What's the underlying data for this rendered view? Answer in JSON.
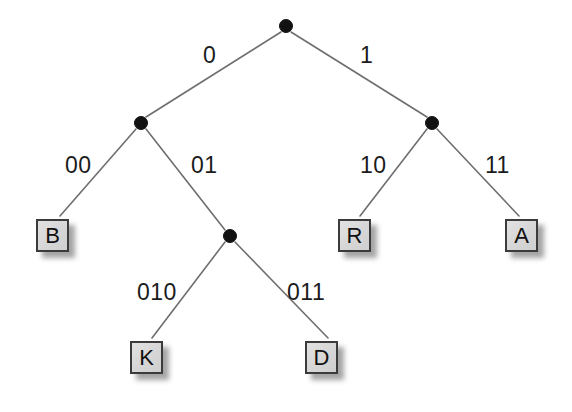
{
  "diagram": {
    "type": "binary-huffman-code-tree",
    "canvas": {
      "width": 572,
      "height": 412,
      "background": "#ffffff"
    },
    "style": {
      "edge_color": "#6e6e6e",
      "node_color": "#121212",
      "box_fill": "#d6d6d6",
      "box_border": "#3b3b3b",
      "text_color": "#1b1b1b",
      "shadow_color": "rgba(40,40,40,0.42)"
    },
    "nodes": [
      {
        "id": "root",
        "kind": "internal",
        "x": 286,
        "y": 26,
        "r": 6.5
      },
      {
        "id": "n0",
        "kind": "internal",
        "x": 141,
        "y": 123,
        "r": 6.5
      },
      {
        "id": "n1",
        "kind": "internal",
        "x": 432,
        "y": 123,
        "r": 6.5
      },
      {
        "id": "n01",
        "kind": "internal",
        "x": 230,
        "y": 236,
        "r": 6.5
      }
    ],
    "leaves": [
      {
        "id": "leaf-b",
        "label": "B",
        "code": "00",
        "x": 36,
        "y": 219
      },
      {
        "id": "leaf-k",
        "label": "K",
        "code": "010",
        "x": 130,
        "y": 341
      },
      {
        "id": "leaf-d",
        "label": "D",
        "code": "011",
        "x": 305,
        "y": 341
      },
      {
        "id": "leaf-r",
        "label": "R",
        "code": "10",
        "x": 338,
        "y": 219
      },
      {
        "id": "leaf-a",
        "label": "A",
        "code": "11",
        "x": 505,
        "y": 219
      }
    ],
    "edges": [
      {
        "id": "edge-0",
        "from": "root",
        "to": "n0",
        "label": "0",
        "label_x": 203,
        "label_y": 44,
        "x1": 281,
        "y1": 32,
        "x2": 146,
        "y2": 117
      },
      {
        "id": "edge-1",
        "from": "root",
        "to": "n1",
        "label": "1",
        "label_x": 360,
        "label_y": 44,
        "x1": 291,
        "y1": 32,
        "x2": 427,
        "y2": 117
      },
      {
        "id": "edge-00",
        "from": "n0",
        "to": "leaf-b",
        "label": "00",
        "label_x": 65,
        "label_y": 154,
        "x1": 136,
        "y1": 129,
        "x2": 60,
        "y2": 216
      },
      {
        "id": "edge-01",
        "from": "n0",
        "to": "n01",
        "label": "01",
        "label_x": 191,
        "label_y": 154,
        "x1": 146,
        "y1": 129,
        "x2": 225,
        "y2": 230
      },
      {
        "id": "edge-10",
        "from": "n1",
        "to": "leaf-r",
        "label": "10",
        "label_x": 360,
        "label_y": 154,
        "x1": 427,
        "y1": 129,
        "x2": 360,
        "y2": 216
      },
      {
        "id": "edge-11",
        "from": "n1",
        "to": "leaf-a",
        "label": "11",
        "label_x": 485,
        "label_y": 154,
        "x1": 437,
        "y1": 129,
        "x2": 519,
        "y2": 216
      },
      {
        "id": "edge-010",
        "from": "n01",
        "to": "leaf-k",
        "label": "010",
        "label_x": 137,
        "label_y": 281,
        "x1": 225,
        "y1": 242,
        "x2": 152,
        "y2": 338
      },
      {
        "id": "edge-011",
        "from": "n01",
        "to": "leaf-d",
        "label": "011",
        "label_x": 287,
        "label_y": 281,
        "x1": 235,
        "y1": 242,
        "x2": 328,
        "y2": 338
      }
    ]
  }
}
